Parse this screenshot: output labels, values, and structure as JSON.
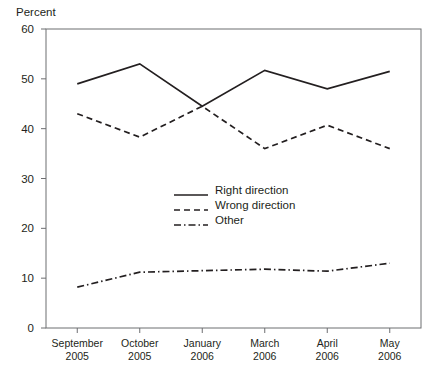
{
  "chart_data": {
    "type": "line",
    "title": "",
    "xlabel": "",
    "ylabel": "Percent",
    "ylim": [
      0,
      60
    ],
    "ytick_step": 10,
    "yticks": [
      0,
      10,
      20,
      30,
      40,
      50,
      60
    ],
    "grid": false,
    "legend_position": "center",
    "categories": [
      "September 2005",
      "October 2005",
      "January 2006",
      "March 2006",
      "April 2006",
      "May 2006"
    ],
    "category_lines": [
      {
        "month": "September",
        "year": "2005"
      },
      {
        "month": "October",
        "year": "2005"
      },
      {
        "month": "January",
        "year": "2006"
      },
      {
        "month": "March",
        "year": "2006"
      },
      {
        "month": "April",
        "year": "2006"
      },
      {
        "month": "May",
        "year": "2006"
      }
    ],
    "series": [
      {
        "name": "Right direction",
        "style": "solid",
        "values": [
          49,
          53,
          44.5,
          51.7,
          48,
          51.5
        ]
      },
      {
        "name": "Wrong direction",
        "style": "dashed",
        "values": [
          43,
          38.3,
          44.5,
          36,
          40.7,
          36
        ]
      },
      {
        "name": "Other",
        "style": "dash-dot",
        "values": [
          8.2,
          11.2,
          11.5,
          11.8,
          11.4,
          13
        ]
      }
    ]
  },
  "colors": {
    "line": "#231f20",
    "axis": "#6d6e71",
    "background": "#ffffff"
  },
  "legend": {
    "items": [
      {
        "label": "Right direction",
        "style": "solid"
      },
      {
        "label": "Wrong direction",
        "style": "dashed"
      },
      {
        "label": "Other",
        "style": "dash-dot"
      }
    ]
  }
}
